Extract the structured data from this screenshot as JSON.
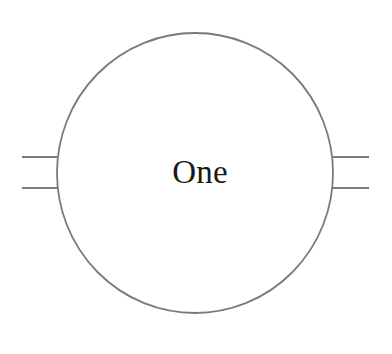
{
  "canvas": {
    "width": 392,
    "height": 354,
    "background_color": "#ffffff"
  },
  "diagram": {
    "type": "node-with-connectors",
    "stroke_color": "#7a7a7a",
    "stroke_width": 1.8,
    "label_color": "#1a1a1a",
    "node": {
      "shape": "circle",
      "label": "One",
      "center_x": 195,
      "center_y": 173,
      "radius_x": 138,
      "radius_y": 140,
      "fill": "#ffffff"
    },
    "connectors": [
      {
        "name": "left-upper-connector",
        "side": "left",
        "x1": 22,
        "y1": 157,
        "x2": 58,
        "y2": 157
      },
      {
        "name": "left-lower-connector",
        "side": "left",
        "x1": 22,
        "y1": 188,
        "x2": 58,
        "y2": 188
      },
      {
        "name": "right-upper-connector",
        "side": "right",
        "x1": 333,
        "y1": 157,
        "x2": 369,
        "y2": 157
      },
      {
        "name": "right-lower-connector",
        "side": "right",
        "x1": 333,
        "y1": 188,
        "x2": 369,
        "y2": 188
      }
    ],
    "label_position": {
      "x": 200,
      "y": 183
    }
  }
}
